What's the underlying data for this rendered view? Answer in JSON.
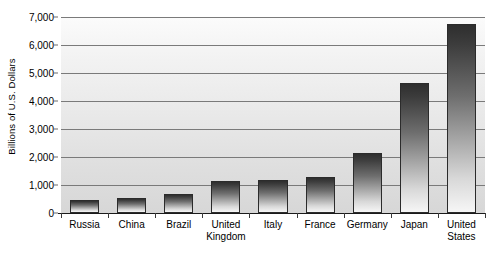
{
  "chart_data": {
    "type": "bar",
    "title": "",
    "xlabel": "",
    "ylabel": "Billions of U.S. Dollars",
    "ylim": [
      0,
      7000
    ],
    "ytick_labels": [
      "0",
      "1,000",
      "2,000",
      "3,000",
      "4,000",
      "5,000",
      "6,000",
      "7,000"
    ],
    "ytick_values": [
      0,
      1000,
      2000,
      3000,
      4000,
      5000,
      6000,
      7000
    ],
    "grid": true,
    "legend": false,
    "categories": [
      "Russia",
      "China",
      "Brazil",
      "United Kingdom",
      "Italy",
      "France",
      "Germany",
      "Japan",
      "United States"
    ],
    "category_lines": [
      [
        "Russia"
      ],
      [
        "China"
      ],
      [
        "Brazil"
      ],
      [
        "United",
        "Kingdom"
      ],
      [
        "Italy"
      ],
      [
        "France"
      ],
      [
        "Germany"
      ],
      [
        "Japan"
      ],
      [
        "United",
        "States"
      ]
    ],
    "values": [
      460,
      540,
      680,
      1130,
      1180,
      1280,
      2150,
      4650,
      6750
    ]
  },
  "style": {
    "bar_top_color": "#2e2e2e",
    "bar_bottom_color": "#f6f6f6",
    "plot_background": "#e7e7e7",
    "gridline_color": "#7a7a7a",
    "axis_color": "#1a1a1a",
    "text_color": "#000000"
  }
}
